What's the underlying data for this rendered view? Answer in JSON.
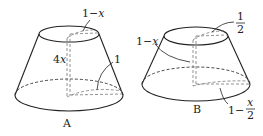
{
  "figures": [
    {
      "id": "A",
      "caption": "A",
      "shape": "frustum",
      "labels": {
        "top_radius": "1−x",
        "height": "4x",
        "bottom_radius": "1"
      }
    },
    {
      "id": "B",
      "caption": "B",
      "shape": "frustum",
      "labels": {
        "top_radius_num": "1",
        "top_radius_den": "2",
        "height": "1−x",
        "bottom_radius_prefix": "1−",
        "bottom_radius_num": "x",
        "bottom_radius_den": "2"
      }
    }
  ]
}
